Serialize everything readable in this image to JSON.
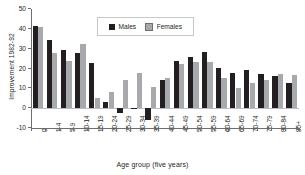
{
  "chart_data": {
    "type": "bar",
    "title": "",
    "xlabel": "Age group (five years)",
    "ylabel": "Improvement 1982-92",
    "ylim": [
      -10,
      50
    ],
    "ytick_values": [
      50,
      40,
      30,
      20,
      10,
      0,
      -10
    ],
    "ytick_labels": [
      "50",
      "40",
      "30",
      "20",
      "10",
      "0",
      "-10"
    ],
    "grid": false,
    "legend_position": "top-center",
    "categories": [
      "0",
      "1-4",
      "5-9",
      "10-14",
      "15-19",
      "20-24",
      "25-29",
      "30-34",
      "35-39",
      "40-44",
      "45-49",
      "50-54",
      "55-59",
      "60-64",
      "65-69",
      "70-74",
      "75-79",
      "80-84",
      "85+"
    ],
    "series": [
      {
        "name": "Males",
        "color": "#231f20",
        "values": [
          41.5,
          34.3,
          29.2,
          28.0,
          22.9,
          3.3,
          -2.2,
          0.2,
          -5.9,
          14.0,
          23.7,
          26.0,
          28.4,
          20.2,
          17.6,
          19.0,
          17.1,
          16.3,
          12.9
        ]
      },
      {
        "name": "Females",
        "color": "#a7a9ac",
        "values": [
          41.1,
          27.8,
          23.6,
          32.4,
          4.9,
          7.9,
          14.0,
          17.7,
          10.8,
          15.4,
          22.3,
          23.4,
          23.3,
          15.4,
          10.4,
          12.6,
          14.2,
          17.2,
          16.6
        ]
      }
    ]
  },
  "legend": {
    "items": [
      {
        "label": "Males"
      },
      {
        "label": "Females"
      }
    ]
  }
}
